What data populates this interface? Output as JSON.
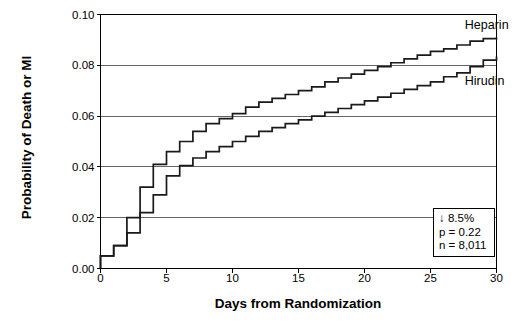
{
  "chart_data": {
    "type": "line",
    "title": "",
    "subtitle": "",
    "xlabel": "Days from Randomization",
    "ylabel": "Probability of Death or MI",
    "xlim": [
      0,
      30
    ],
    "ylim": [
      0.0,
      0.1
    ],
    "xticks": [
      "0",
      "5",
      "10",
      "15",
      "20",
      "25",
      "30"
    ],
    "xtick_values": [
      0,
      5,
      10,
      15,
      20,
      25,
      30
    ],
    "yticks": [
      "0.00",
      "0.02",
      "0.04",
      "0.06",
      "0.08",
      "0.10"
    ],
    "ytick_values": [
      0.0,
      0.02,
      0.04,
      0.06,
      0.08,
      0.1
    ],
    "grid": "horizontal",
    "legend_position": "inline-right",
    "step_style": "post",
    "series": [
      {
        "name": "Heparin",
        "label_x": 27.6,
        "label_y": 0.0955,
        "x": [
          0,
          1,
          2,
          3,
          4,
          5,
          6,
          7,
          8,
          9,
          10,
          11,
          12,
          13,
          14,
          15,
          16,
          17,
          18,
          19,
          20,
          21,
          22,
          23,
          24,
          25,
          26,
          27,
          28,
          29,
          30
        ],
        "values": [
          0.005,
          0.009,
          0.02,
          0.032,
          0.041,
          0.046,
          0.05,
          0.054,
          0.057,
          0.059,
          0.061,
          0.0635,
          0.0655,
          0.067,
          0.0685,
          0.07,
          0.0715,
          0.0735,
          0.075,
          0.0765,
          0.078,
          0.0795,
          0.081,
          0.0825,
          0.084,
          0.0855,
          0.0865,
          0.088,
          0.0895,
          0.0905,
          0.091
        ]
      },
      {
        "name": "Hirudin",
        "label_x": 27.6,
        "label_y": 0.0735,
        "x": [
          0,
          1,
          2,
          3,
          4,
          5,
          6,
          7,
          8,
          9,
          10,
          11,
          12,
          13,
          14,
          15,
          16,
          17,
          18,
          19,
          20,
          21,
          22,
          23,
          24,
          25,
          26,
          27,
          28,
          29,
          30
        ],
        "values": [
          0.005,
          0.009,
          0.014,
          0.022,
          0.029,
          0.0365,
          0.0405,
          0.0435,
          0.046,
          0.048,
          0.05,
          0.052,
          0.054,
          0.0555,
          0.057,
          0.0585,
          0.06,
          0.0615,
          0.063,
          0.0645,
          0.066,
          0.0675,
          0.069,
          0.0705,
          0.072,
          0.0735,
          0.0755,
          0.077,
          0.0795,
          0.082,
          0.0835
        ]
      }
    ],
    "annotation_box": {
      "line1": "↓ 8.5%",
      "line2": "p = 0.22",
      "line3": "n = 8,011"
    }
  }
}
